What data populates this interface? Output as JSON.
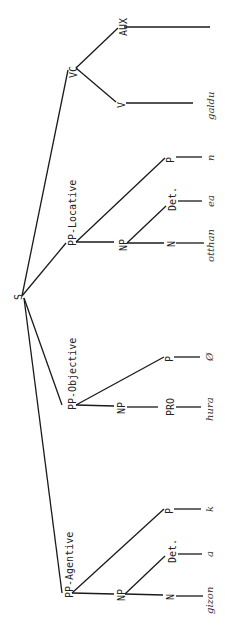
{
  "diagram": {
    "type": "syntax-tree",
    "orientation": "rotated-90-clockwise",
    "root": {
      "label": "S"
    },
    "nodes": {
      "s": {
        "label": "S"
      },
      "vc": {
        "label": "VC"
      },
      "aux": {
        "label": "AUX"
      },
      "v": {
        "label": "V"
      },
      "v_word": {
        "label": "galdu"
      },
      "pp_loc": {
        "label": "PP-Locative"
      },
      "pp_loc_np": {
        "label": "NP"
      },
      "pp_loc_n": {
        "label": "N"
      },
      "pp_loc_n_word": {
        "label": "otthan"
      },
      "pp_loc_det": {
        "label": "Det."
      },
      "pp_loc_det_word": {
        "label": "ea"
      },
      "pp_loc_p": {
        "label": "P"
      },
      "pp_loc_p_word": {
        "label": "n"
      },
      "pp_obj": {
        "label": "PP-Objective"
      },
      "pp_obj_np": {
        "label": "NP"
      },
      "pp_obj_pro": {
        "label": "PRO"
      },
      "pp_obj_pro_word": {
        "label": "hura"
      },
      "pp_obj_p": {
        "label": "P"
      },
      "pp_obj_p_word": {
        "label": "Ø"
      },
      "pp_agt": {
        "label": "PP-Agentive"
      },
      "pp_agt_np": {
        "label": "NP"
      },
      "pp_agt_n": {
        "label": "N"
      },
      "pp_agt_n_word": {
        "label": "gizon"
      },
      "pp_agt_det": {
        "label": "Det."
      },
      "pp_agt_det_word": {
        "label": "a"
      },
      "pp_agt_p": {
        "label": "P"
      },
      "pp_agt_p_word": {
        "label": "k"
      }
    },
    "edges": [
      [
        "S",
        "VC"
      ],
      [
        "VC",
        "AUX"
      ],
      [
        "VC",
        "V"
      ],
      [
        "V",
        "galdu"
      ],
      [
        "S",
        "PP-Locative"
      ],
      [
        "PP-Locative",
        "NP"
      ],
      [
        "PP-Locative",
        "P"
      ],
      [
        "NP",
        "N"
      ],
      [
        "NP",
        "Det."
      ],
      [
        "N",
        "otthan"
      ],
      [
        "Det.",
        "ea"
      ],
      [
        "P",
        "n"
      ],
      [
        "S",
        "PP-Objective"
      ],
      [
        "PP-Objective",
        "NP"
      ],
      [
        "PP-Objective",
        "P"
      ],
      [
        "NP",
        "PRO"
      ],
      [
        "PRO",
        "hura"
      ],
      [
        "P",
        "Ø"
      ],
      [
        "S",
        "PP-Agentive"
      ],
      [
        "PP-Agentive",
        "NP"
      ],
      [
        "PP-Agentive",
        "P"
      ],
      [
        "NP",
        "N"
      ],
      [
        "NP",
        "Det."
      ],
      [
        "N",
        "gizon"
      ],
      [
        "Det.",
        "a"
      ],
      [
        "P",
        "k"
      ]
    ]
  }
}
